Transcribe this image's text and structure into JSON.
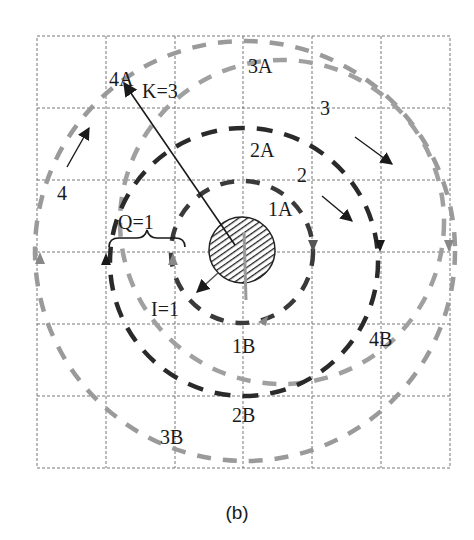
{
  "caption": "(b)",
  "colors": {
    "dark_dash": "#2a2a2a",
    "gray_dash": "#9a9a9a",
    "grid": "#777777",
    "hatch": "#222222"
  },
  "grid": {
    "rows": 6,
    "cols": 6,
    "x_lines": [
      37,
      106,
      175,
      243,
      312,
      381,
      450
    ],
    "y_lines": [
      36,
      108,
      180,
      252,
      324,
      396,
      468
    ]
  },
  "labels": {
    "l4A": "4A",
    "lK": "K=3",
    "l3A": "3A",
    "l3": "3",
    "l2A": "2A",
    "l2": "2",
    "l1A": "1A",
    "l4": "4",
    "lQ": "Q=1",
    "lI": "I=1",
    "l1B": "1B",
    "l4B": "4B",
    "l2B": "2B",
    "l3B": "3B"
  },
  "circles": [
    {
      "id": "1",
      "cx": 242,
      "cy": 252,
      "r": 71,
      "style": "dark"
    },
    {
      "id": "2",
      "cx": 244,
      "cy": 262,
      "r": 134,
      "style": "dark"
    },
    {
      "id": "3",
      "cx": 245,
      "cy": 251,
      "r": 210,
      "style": "gray"
    },
    {
      "id": "4",
      "cx": 282,
      "cy": 222,
      "r": 162,
      "style": "gray"
    }
  ],
  "center_obstacle": {
    "cx": 242,
    "cy": 250,
    "r": 33,
    "fill": "hatched"
  }
}
